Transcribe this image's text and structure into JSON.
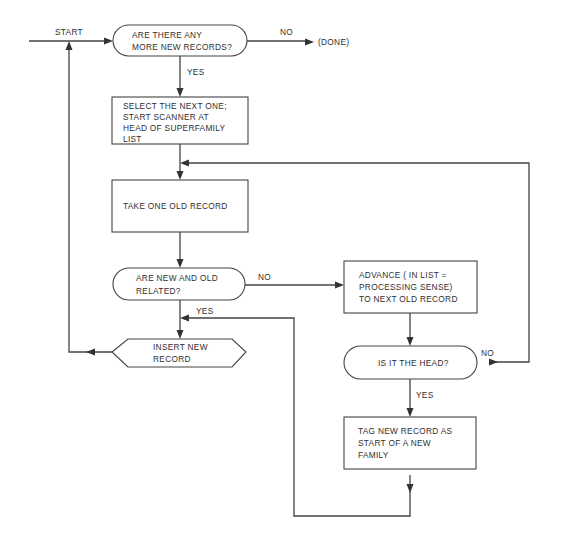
{
  "diagram": {
    "type": "flowchart",
    "colors": {
      "stroke": "#444444",
      "text": "#2f2f2f",
      "background": "#ffffff"
    },
    "nodes": [
      {
        "id": "more-records",
        "shape": "terminal",
        "lines": [
          "ARE THERE ANY",
          "MORE NEW RECORDS?"
        ]
      },
      {
        "id": "select-next",
        "shape": "process",
        "lines": [
          "SELECT THE NEXT ONE;",
          "START SCANNER AT",
          "HEAD OF SUPERFAMILY",
          "LIST"
        ]
      },
      {
        "id": "take-old",
        "shape": "process",
        "lines": [
          "TAKE ONE OLD RECORD"
        ]
      },
      {
        "id": "related",
        "shape": "terminal",
        "lines": [
          "ARE NEW AND OLD",
          "RELATED?"
        ]
      },
      {
        "id": "insert-new",
        "shape": "hexagon",
        "lines": [
          "INSERT NEW",
          "RECORD"
        ]
      },
      {
        "id": "advance",
        "shape": "process",
        "lines": [
          "ADVANCE ( IN LIST =",
          "PROCESSING SENSE)",
          "TO NEXT OLD RECORD"
        ]
      },
      {
        "id": "is-head",
        "shape": "terminal",
        "lines": [
          "IS IT THE HEAD?"
        ]
      },
      {
        "id": "tag-new",
        "shape": "process",
        "lines": [
          "TAG NEW RECORD AS",
          "START OF A NEW",
          "FAMILY"
        ]
      }
    ],
    "labels": {
      "start": "START",
      "done": "(DONE)",
      "more_no": "NO",
      "more_yes": "YES",
      "related_no": "NO",
      "related_yes": "YES",
      "head_no": "NO",
      "head_yes": "YES"
    },
    "edges": [
      {
        "from": "start",
        "to": "more-records"
      },
      {
        "from": "more-records",
        "to": "done",
        "label": "NO"
      },
      {
        "from": "more-records",
        "to": "select-next",
        "label": "YES"
      },
      {
        "from": "select-next",
        "to": "take-old"
      },
      {
        "from": "take-old",
        "to": "related"
      },
      {
        "from": "related",
        "to": "advance",
        "label": "NO"
      },
      {
        "from": "related",
        "to": "insert-new",
        "label": "YES"
      },
      {
        "from": "insert-new",
        "to": "more-records"
      },
      {
        "from": "advance",
        "to": "is-head"
      },
      {
        "from": "is-head",
        "to": "take-old",
        "label": "NO"
      },
      {
        "from": "is-head",
        "to": "tag-new",
        "label": "YES"
      },
      {
        "from": "tag-new",
        "to": "insert-new"
      }
    ]
  }
}
